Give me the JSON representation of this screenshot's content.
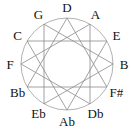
{
  "diagram": {
    "center": [
      67,
      64
    ],
    "radius": 46,
    "label_radius": 57,
    "circle_color": "#a8a8a8",
    "line_color": "#8a8a8a",
    "notes": [
      "D",
      "A",
      "E",
      "B",
      "F#",
      "Db",
      "Ab",
      "Eb",
      "Bb",
      "F",
      "C",
      "G"
    ],
    "triangles": [
      [
        "D",
        "F#",
        "Bb"
      ],
      [
        "A",
        "Db",
        "F"
      ],
      [
        "E",
        "Ab",
        "C"
      ],
      [
        "B",
        "Eb",
        "G"
      ]
    ]
  }
}
